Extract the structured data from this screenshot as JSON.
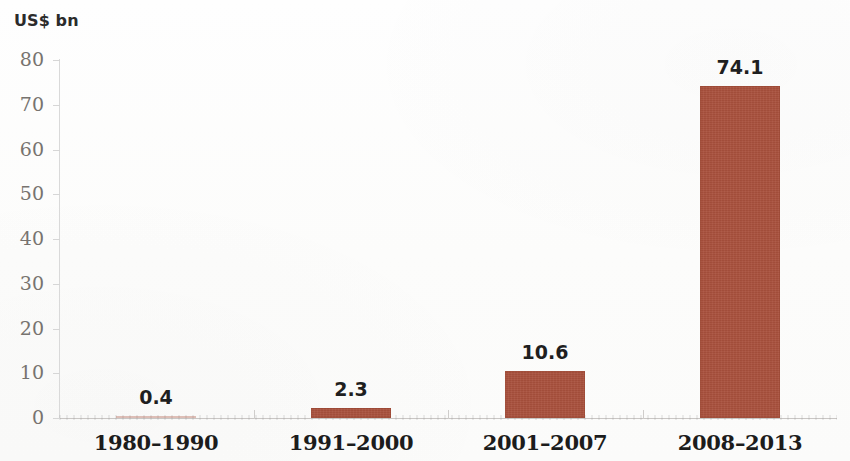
{
  "unit_label": "US$ bn",
  "chart_data": {
    "type": "bar",
    "title": "",
    "subtitle": "",
    "xlabel": "",
    "ylabel": "US$ bn",
    "categories": [
      "1980–1990",
      "1991–2000",
      "2001–2007",
      "2008–2013"
    ],
    "values": [
      0.4,
      2.3,
      10.6,
      74.1
    ],
    "data_labels": [
      "0.4",
      "2.3",
      "10.6",
      "74.1"
    ],
    "ylim": [
      0,
      80
    ],
    "y_ticks": [
      0,
      10,
      20,
      30,
      40,
      50,
      60,
      70,
      80
    ],
    "y_tick_labels": [
      "0",
      "10",
      "20",
      "30",
      "40",
      "50",
      "60",
      "70",
      "80"
    ],
    "grid": false,
    "legend": null,
    "legend_position": "none",
    "bar_color": "#a8503c",
    "axis_color": "#d0cecc",
    "tick_label_color": "#77736f",
    "data_label_color": "#1f1f1f",
    "category_label_color": "#1c1c1c",
    "background_color": "#fdfdfc"
  }
}
